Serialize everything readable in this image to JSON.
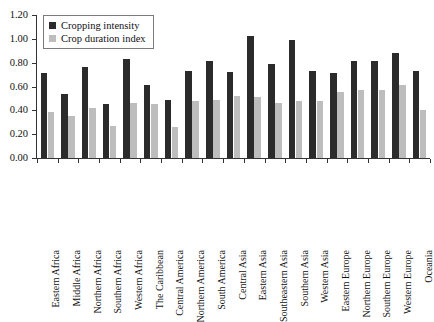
{
  "chart_data": {
    "type": "bar",
    "title": "",
    "subtitle": "",
    "xlabel": "",
    "ylabel": "",
    "ylim": [
      0.0,
      1.2
    ],
    "ytick_labels": [
      "0.00",
      "0.20",
      "0.40",
      "0.60",
      "0.80",
      "1.00",
      "1.20"
    ],
    "ytick_values": [
      0.0,
      0.2,
      0.4,
      0.6,
      0.8,
      1.0,
      1.2
    ],
    "grid": false,
    "legend_position": "top-left",
    "categories": [
      "Eastern Africa",
      "Middle Africa",
      "Northern Africa",
      "Southern Africa",
      "Western Africa",
      "The Caribbean",
      "Central America",
      "Northern America",
      "South America",
      "Central Asia",
      "Eastern Asia",
      "Southeastern Asia",
      "Southern Asia",
      "Western Asia",
      "Eastern Europe",
      "Northern Europe",
      "Southern Europe",
      "Western Europe",
      "Oceania"
    ],
    "series": [
      {
        "name": "Cropping intensity",
        "color": "#2b2b2b",
        "values": [
          0.71,
          0.54,
          0.76,
          0.45,
          0.83,
          0.61,
          0.49,
          0.73,
          0.81,
          0.72,
          1.02,
          0.79,
          0.99,
          0.73,
          0.71,
          0.81,
          0.81,
          0.88,
          0.73
        ]
      },
      {
        "name": "Crop duration index",
        "color": "#bdbdbd",
        "values": [
          0.39,
          0.35,
          0.42,
          0.27,
          0.46,
          0.45,
          0.26,
          0.48,
          0.49,
          0.52,
          0.51,
          0.46,
          0.48,
          0.48,
          0.55,
          0.57,
          0.57,
          0.61,
          0.4
        ]
      }
    ]
  },
  "legend": {
    "items": [
      {
        "label": "Cropping intensity"
      },
      {
        "label": "Crop duration index"
      }
    ]
  }
}
